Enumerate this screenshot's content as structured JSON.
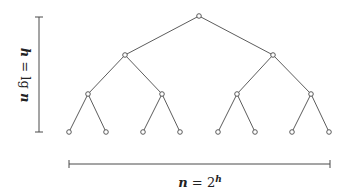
{
  "diagram": {
    "height_label": {
      "var": "h",
      "eq": " = ",
      "func": "lg",
      "arg": "n"
    },
    "width_label": {
      "var": "n",
      "eq": " = ",
      "base": "2",
      "exp": "h"
    },
    "levels": 4,
    "leaf_count": 8,
    "colors": {
      "stroke": "#4a4a4a",
      "node_fill": "#ffffff",
      "background": "#ffffff"
    }
  }
}
